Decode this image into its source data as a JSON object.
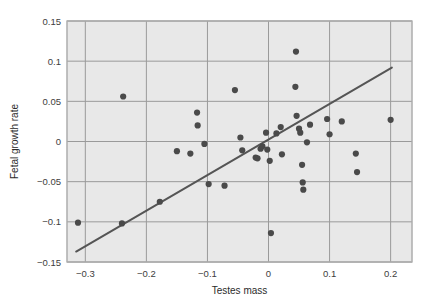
{
  "chart_data": {
    "type": "scatter",
    "title": "",
    "xlabel": "Testes mass",
    "ylabel": "Fetal growth rate",
    "xlim": [
      -0.33,
      0.235
    ],
    "ylim": [
      -0.15,
      0.15
    ],
    "xticks": [
      -0.3,
      -0.2,
      -0.1,
      0,
      0.1,
      0.2
    ],
    "xtick_labels": [
      "−0.3",
      "−0.2",
      "−0.1",
      "0",
      "0.1",
      "0.2"
    ],
    "yticks": [
      -0.15,
      -0.1,
      -0.05,
      0,
      0.05,
      0.1,
      0.15
    ],
    "ytick_labels": [
      "−0.15",
      "−0.1",
      "−0.05",
      "0",
      "0.05",
      "0.1",
      "0.15"
    ],
    "grid": true,
    "legend": null,
    "plot_bg_color": "#e8e8e8",
    "grid_color": "#9a9a9a",
    "point_color": "#4a4a4a",
    "line_color": "#555555",
    "points": [
      {
        "x": -0.312,
        "y": -0.101
      },
      {
        "x": -0.24,
        "y": -0.102
      },
      {
        "x": -0.238,
        "y": 0.056
      },
      {
        "x": -0.178,
        "y": -0.075
      },
      {
        "x": -0.15,
        "y": -0.012
      },
      {
        "x": -0.128,
        "y": -0.015
      },
      {
        "x": -0.117,
        "y": 0.036
      },
      {
        "x": -0.116,
        "y": 0.02
      },
      {
        "x": -0.105,
        "y": -0.003
      },
      {
        "x": -0.098,
        "y": -0.053
      },
      {
        "x": -0.072,
        "y": -0.055
      },
      {
        "x": -0.055,
        "y": 0.064
      },
      {
        "x": -0.046,
        "y": 0.005
      },
      {
        "x": -0.043,
        "y": -0.011
      },
      {
        "x": -0.021,
        "y": -0.02
      },
      {
        "x": -0.018,
        "y": -0.021
      },
      {
        "x": -0.013,
        "y": -0.009
      },
      {
        "x": -0.01,
        "y": -0.006
      },
      {
        "x": -0.004,
        "y": 0.011
      },
      {
        "x": -0.002,
        "y": -0.01
      },
      {
        "x": 0.002,
        "y": -0.024
      },
      {
        "x": 0.004,
        "y": -0.114
      },
      {
        "x": 0.013,
        "y": 0.01
      },
      {
        "x": 0.02,
        "y": 0.018
      },
      {
        "x": 0.022,
        "y": -0.016
      },
      {
        "x": 0.045,
        "y": 0.112
      },
      {
        "x": 0.044,
        "y": 0.068
      },
      {
        "x": 0.046,
        "y": 0.032
      },
      {
        "x": 0.05,
        "y": 0.016
      },
      {
        "x": 0.052,
        "y": 0.011
      },
      {
        "x": 0.055,
        "y": -0.029
      },
      {
        "x": 0.056,
        "y": -0.051
      },
      {
        "x": 0.057,
        "y": -0.06
      },
      {
        "x": 0.063,
        "y": -0.001
      },
      {
        "x": 0.068,
        "y": 0.021
      },
      {
        "x": 0.096,
        "y": 0.028
      },
      {
        "x": 0.1,
        "y": 0.009
      },
      {
        "x": 0.12,
        "y": 0.025
      },
      {
        "x": 0.143,
        "y": -0.015
      },
      {
        "x": 0.145,
        "y": -0.038
      },
      {
        "x": 0.2,
        "y": 0.027
      }
    ],
    "trendline": {
      "label": "regression line",
      "x1": -0.315,
      "y1": -0.137,
      "x2": 0.202,
      "y2": 0.092
    }
  }
}
